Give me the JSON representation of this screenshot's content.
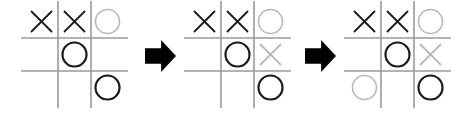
{
  "figure": {
    "type": "tic-tac-toe-sequence",
    "background_color": "#ffffff",
    "board_count": 3,
    "arrow_count": 2
  },
  "style": {
    "grid_line_color": "#9a9a9a",
    "grid_line_width": 1.6,
    "mark_dark_color": "#1a1a1a",
    "mark_light_color": "#b8b8b8",
    "x_stroke_width_dark": 1.8,
    "x_stroke_width_light": 1.8,
    "o_stroke_width_dark": 2.2,
    "o_stroke_width_light": 1.6,
    "arrow_color": "#000000"
  },
  "geometry": {
    "cell_size": 33,
    "grid_overhang": 4,
    "o_radius": 12,
    "x_half": 10,
    "board_left_positions": [
      25,
      188,
      348
    ],
    "board_top": 5,
    "arrow_positions": [
      {
        "x": 145,
        "y": 40,
        "width": 31,
        "height": 32
      },
      {
        "x": 305,
        "y": 40,
        "width": 31,
        "height": 32
      }
    ]
  },
  "boards": [
    {
      "name": "board-1",
      "label": "Board 1",
      "cells": [
        {
          "row": 0,
          "col": 0,
          "mark": "X",
          "tone": "dark"
        },
        {
          "row": 0,
          "col": 1,
          "mark": "X",
          "tone": "dark"
        },
        {
          "row": 0,
          "col": 2,
          "mark": "O",
          "tone": "light"
        },
        {
          "row": 1,
          "col": 0,
          "mark": "",
          "tone": ""
        },
        {
          "row": 1,
          "col": 1,
          "mark": "O",
          "tone": "dark"
        },
        {
          "row": 1,
          "col": 2,
          "mark": "",
          "tone": ""
        },
        {
          "row": 2,
          "col": 0,
          "mark": "",
          "tone": ""
        },
        {
          "row": 2,
          "col": 1,
          "mark": "",
          "tone": ""
        },
        {
          "row": 2,
          "col": 2,
          "mark": "O",
          "tone": "dark"
        }
      ]
    },
    {
      "name": "board-2",
      "label": "Board 2",
      "cells": [
        {
          "row": 0,
          "col": 0,
          "mark": "X",
          "tone": "dark"
        },
        {
          "row": 0,
          "col": 1,
          "mark": "X",
          "tone": "dark"
        },
        {
          "row": 0,
          "col": 2,
          "mark": "O",
          "tone": "light"
        },
        {
          "row": 1,
          "col": 0,
          "mark": "",
          "tone": ""
        },
        {
          "row": 1,
          "col": 1,
          "mark": "O",
          "tone": "dark"
        },
        {
          "row": 1,
          "col": 2,
          "mark": "X",
          "tone": "light"
        },
        {
          "row": 2,
          "col": 0,
          "mark": "",
          "tone": ""
        },
        {
          "row": 2,
          "col": 1,
          "mark": "",
          "tone": ""
        },
        {
          "row": 2,
          "col": 2,
          "mark": "O",
          "tone": "dark"
        }
      ]
    },
    {
      "name": "board-3",
      "label": "Board 3",
      "cells": [
        {
          "row": 0,
          "col": 0,
          "mark": "X",
          "tone": "dark"
        },
        {
          "row": 0,
          "col": 1,
          "mark": "X",
          "tone": "dark"
        },
        {
          "row": 0,
          "col": 2,
          "mark": "O",
          "tone": "light"
        },
        {
          "row": 1,
          "col": 0,
          "mark": "",
          "tone": ""
        },
        {
          "row": 1,
          "col": 1,
          "mark": "O",
          "tone": "dark"
        },
        {
          "row": 1,
          "col": 2,
          "mark": "X",
          "tone": "light"
        },
        {
          "row": 2,
          "col": 0,
          "mark": "O",
          "tone": "light"
        },
        {
          "row": 2,
          "col": 1,
          "mark": "",
          "tone": ""
        },
        {
          "row": 2,
          "col": 2,
          "mark": "O",
          "tone": "dark"
        }
      ]
    }
  ],
  "arrows": [
    {
      "name": "arrow-1",
      "direction": "right",
      "label": "next step"
    },
    {
      "name": "arrow-2",
      "direction": "right",
      "label": "next step"
    }
  ]
}
